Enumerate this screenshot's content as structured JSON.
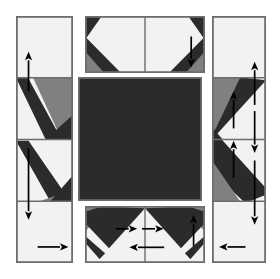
{
  "figure": {
    "kind": "quilt-block-assembly-diagram",
    "title": "",
    "background_color": "#ffffff",
    "canvas": {
      "width": 280,
      "height": 279
    }
  },
  "palette": {
    "dark": "#2b2b2b",
    "mid_gray": "#808080",
    "light": "#f2f2f2",
    "outline": "#6d6d6d",
    "arrow": "#000000",
    "background": "#ffffff"
  },
  "panels": [
    {
      "id": "left-strip",
      "name": "left-side-strip",
      "x": 16,
      "y": 16,
      "w": 57,
      "h": 247,
      "segments": 4,
      "seam_positions": [
        0.25,
        0.5,
        0.75
      ],
      "arrows": [
        {
          "name": "arrow-up-left-upper",
          "direction": "up",
          "x1": 0.22,
          "y1": 0.305,
          "x2": 0.22,
          "y2": 0.145
        },
        {
          "name": "arrow-down-left-lower",
          "direction": "down",
          "x1": 0.22,
          "y1": 0.535,
          "x2": 0.22,
          "y2": 0.825
        },
        {
          "name": "arrow-right-left-foot",
          "direction": "right",
          "x1": 0.38,
          "y1": 0.935,
          "x2": 0.92,
          "y2": 0.935
        }
      ]
    },
    {
      "id": "top-strip",
      "name": "top-side-strip",
      "x": 85,
      "y": 16,
      "w": 120,
      "h": 57,
      "segments": 2,
      "seam_positions": [
        0.5
      ],
      "arrows": [
        {
          "name": "arrow-down-top-right",
          "direction": "down",
          "x1": 0.885,
          "y1": 0.36,
          "x2": 0.885,
          "y2": 0.9
        }
      ]
    },
    {
      "id": "right-strip",
      "name": "right-side-strip",
      "x": 212,
      "y": 16,
      "w": 54,
      "h": 247,
      "segments": 4,
      "seam_positions": [
        0.25,
        0.5,
        0.75
      ],
      "arrows": [
        {
          "name": "arrow-up-right-upper",
          "direction": "up",
          "x1": 0.79,
          "y1": 0.36,
          "x2": 0.79,
          "y2": 0.185
        },
        {
          "name": "arrow-up-right-diagonal",
          "direction": "up",
          "x1": 0.4,
          "y1": 0.455,
          "x2": 0.4,
          "y2": 0.305
        },
        {
          "name": "arrow-down-right-mid",
          "direction": "down",
          "x1": 0.79,
          "y1": 0.385,
          "x2": 0.79,
          "y2": 0.555
        },
        {
          "name": "arrow-up-right-lower",
          "direction": "up",
          "x1": 0.4,
          "y1": 0.655,
          "x2": 0.4,
          "y2": 0.505
        },
        {
          "name": "arrow-down-right-foot",
          "direction": "down",
          "x1": 0.79,
          "y1": 0.585,
          "x2": 0.79,
          "y2": 0.845
        },
        {
          "name": "arrow-left-right-foot",
          "direction": "left",
          "x1": 0.62,
          "y1": 0.935,
          "x2": 0.13,
          "y2": 0.935
        }
      ]
    },
    {
      "id": "bottom-strip",
      "name": "bottom-side-strip",
      "x": 85,
      "y": 206,
      "w": 120,
      "h": 57,
      "segments": 2,
      "seam_positions": [
        0.5
      ],
      "arrows": [
        {
          "name": "arrow-right-bottom-inner",
          "direction": "right",
          "x1": 0.255,
          "y1": 0.4,
          "x2": 0.435,
          "y2": 0.4
        },
        {
          "name": "arrow-right-bottom-mid",
          "direction": "right",
          "x1": 0.475,
          "y1": 0.4,
          "x2": 0.655,
          "y2": 0.4
        },
        {
          "name": "arrow-left-bottom",
          "direction": "left",
          "x1": 0.66,
          "y1": 0.725,
          "x2": 0.37,
          "y2": 0.725
        },
        {
          "name": "arrow-up-bottom-right",
          "direction": "up",
          "x1": 0.905,
          "y1": 0.7,
          "x2": 0.905,
          "y2": 0.16
        }
      ]
    },
    {
      "id": "center-square",
      "name": "center-square",
      "x": 78,
      "y": 77,
      "w": 124,
      "h": 124,
      "fill": "dark"
    }
  ],
  "labels": {
    "center_square": "center square",
    "left_strip": "left strip",
    "right_strip": "right strip",
    "top_strip": "top strip",
    "bottom_strip": "bottom strip"
  }
}
